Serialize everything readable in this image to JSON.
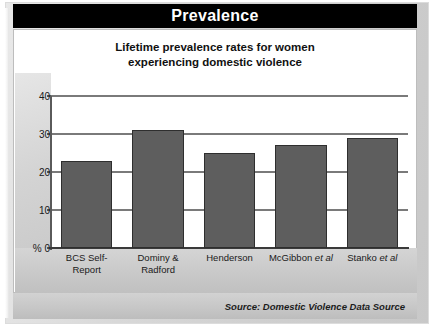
{
  "header": {
    "title": "Prevalence"
  },
  "subtitle": {
    "line1": "Lifetime prevalence rates for women",
    "line2": "experiencing domestic violence"
  },
  "footer": {
    "source": "Source: Domestic Violence Data Source"
  },
  "axis": {
    "y_unit_label": "%",
    "ticks": [
      "40",
      "30",
      "20",
      "10",
      "0"
    ]
  },
  "chart_data": {
    "type": "bar",
    "title": "Lifetime prevalence rates for women experiencing domestic violence",
    "categories": [
      "BCS Self-Report",
      "Dominy & Radford",
      "Henderson",
      "McGibbon et al",
      "Stanko et al"
    ],
    "category_lines": [
      [
        "BCS Self-",
        "Report"
      ],
      [
        "Dominy &",
        "Radford"
      ],
      [
        "Henderson",
        ""
      ],
      [
        "McGibbon ",
        "et al"
      ],
      [
        "Stanko ",
        "et al"
      ]
    ],
    "values": [
      23,
      31,
      25,
      27,
      29
    ],
    "xlabel": "",
    "ylabel": "%",
    "ylim": [
      0,
      40
    ],
    "ytick_values": [
      0,
      10,
      20,
      30,
      40
    ],
    "grid": true,
    "legend": false,
    "bar_color": "#5e5e5e",
    "gridline_color": "#7a7a7a",
    "title_bar_color": "#000000",
    "panel_color": "#ffffff"
  }
}
